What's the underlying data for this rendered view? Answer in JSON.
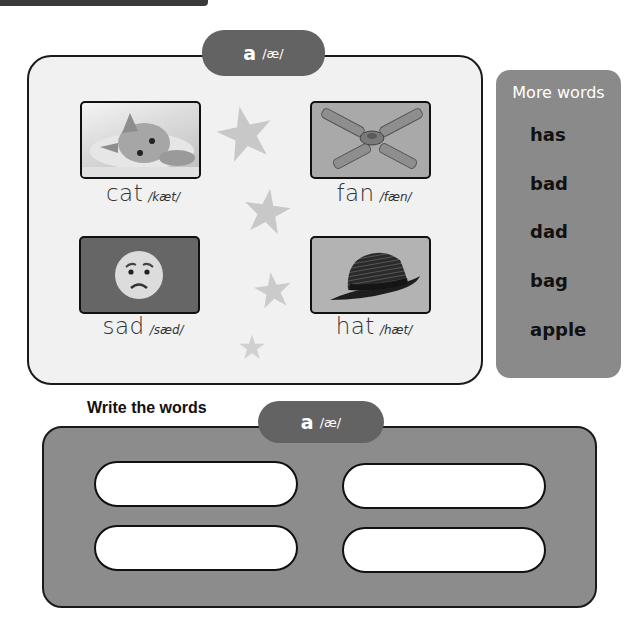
{
  "header": {
    "phoneme_letter": "a",
    "phoneme_ipa": "/æ/"
  },
  "picture_cards": [
    {
      "word": "cat",
      "ipa": "/kæt/",
      "image": "kitten-photo"
    },
    {
      "word": "fan",
      "ipa": "/fæn/",
      "image": "ceiling-fan-photo"
    },
    {
      "word": "sad",
      "ipa": "/sæd/",
      "image": "sad-face-emoji"
    },
    {
      "word": "hat",
      "ipa": "/hæt/",
      "image": "fedora-hat-photo"
    }
  ],
  "more_words": {
    "title": "More words",
    "items": [
      "has",
      "bad",
      "dad",
      "bag",
      "apple"
    ]
  },
  "write_section": {
    "title": "Write the words",
    "phoneme_letter": "a",
    "phoneme_ipa": "/æ/",
    "inputs": [
      {
        "value": "",
        "placeholder": ""
      },
      {
        "value": "",
        "placeholder": ""
      },
      {
        "value": "",
        "placeholder": ""
      },
      {
        "value": "",
        "placeholder": ""
      }
    ]
  },
  "colors": {
    "pill": "#636363",
    "main_panel_bg": "#f1f1f1",
    "more_panel_bg": "#8a8a8a",
    "write_panel_bg": "#8c8c8c",
    "star": "#c8c8c8",
    "border": "#1a1a1a"
  }
}
